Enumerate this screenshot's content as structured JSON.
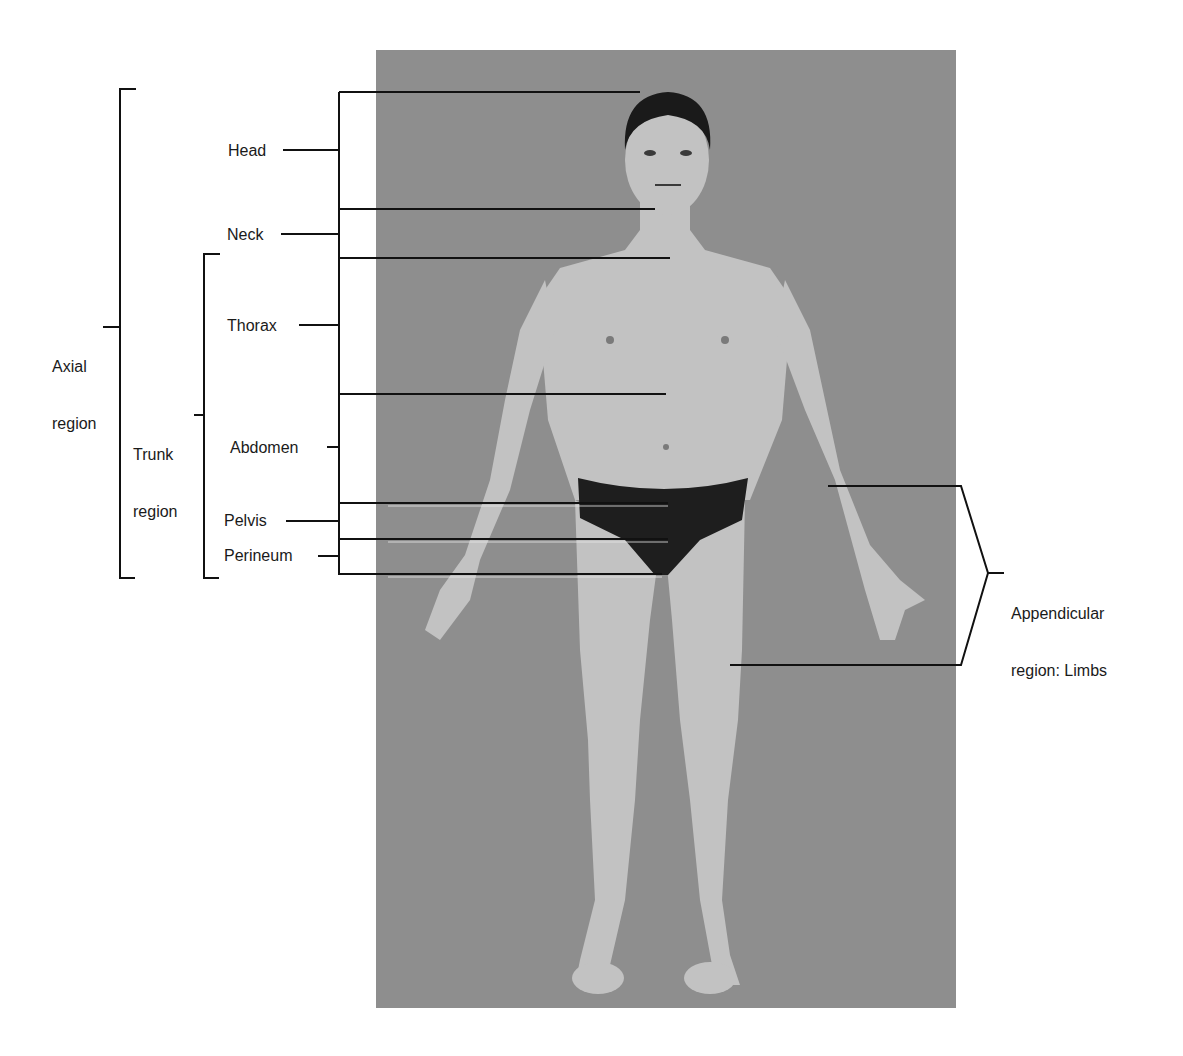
{
  "figure": {
    "photo": {
      "background_color": "#8c8c8c",
      "skin_color": "#c4c4c4",
      "brief_color": "#1e1e1e",
      "hair_color": "#1a1a1a"
    },
    "line_color": "#111111"
  },
  "labels": {
    "axial": {
      "line1": "Axial",
      "line2": "region"
    },
    "trunk": {
      "line1": "Trunk",
      "line2": "region"
    },
    "head": "Head",
    "neck": "Neck",
    "thorax": "Thorax",
    "abdomen": "Abdomen",
    "pelvis": "Pelvis",
    "perineum": "Perineum",
    "appendicular": {
      "line1": "Appendicular",
      "line2": "region: Limbs"
    }
  }
}
